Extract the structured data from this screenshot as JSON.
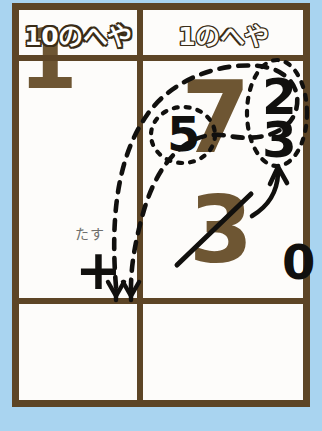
{
  "card": {
    "title_row": {
      "tens_room_label": "10のへや",
      "ones_room_label": "1のへや"
    },
    "work_row": {
      "tens_cell": {
        "operator_hint_label": "たす",
        "operator_symbol": "+"
      },
      "ones_cell": {
        "minuend_digit": "7",
        "decomposed_digit": "5",
        "addend_top_digit": "2",
        "addend_bottom_digit": "3",
        "crossed_out_digit": "3",
        "result_ones_digit": "0"
      }
    },
    "answer_row": {
      "tens_answer_digit": "1",
      "ones_answer_digit": ""
    }
  },
  "annotations": {
    "big_dashed_loop_name": "carry-loop",
    "small_dashed_circle_name": "five-highlight",
    "dashed_oval_name": "two-three-group",
    "curved_arrow_name": "regroup-arrow",
    "strike_name": "three-strikethrough",
    "dashed_arrow_left_name": "carry-arrow-left",
    "dashed_arrow_right_name": "carry-arrow-right"
  },
  "colors": {
    "background": "#a9d4f0",
    "card_background": "#fdfcfa",
    "frame_brown": "#5d4526",
    "numeral_brown": "#6e5633",
    "ink_black": "#11100e",
    "hint_gray": "#6f6f6c"
  }
}
